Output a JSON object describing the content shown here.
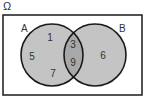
{
  "diagram": {
    "type": "venn",
    "universe_label": "Ω",
    "sets": [
      {
        "name": "A",
        "label": "A"
      },
      {
        "name": "B",
        "label": "B"
      }
    ],
    "regions": {
      "A_only": [
        "1",
        "5",
        "7"
      ],
      "A_and_B": [
        "3",
        "9"
      ],
      "B_only": [
        "6"
      ]
    },
    "colors": {
      "fill": "#c4c4c4",
      "intersection_fill": "#a8a8a8",
      "stroke": "#1a1a1a",
      "text": "#333333"
    }
  }
}
